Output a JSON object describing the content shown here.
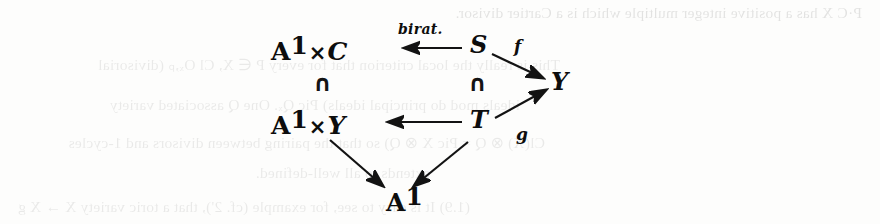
{
  "page": {
    "width": 880,
    "height": 224,
    "background_color": "#fdfdfc",
    "ink_color": "#0d0d0d"
  },
  "diagram": {
    "nodes": [
      {
        "id": "a1c",
        "label": "A¹×C",
        "base": "A",
        "exponent": "1",
        "operator": "×",
        "factor": "C"
      },
      {
        "id": "s",
        "label": "S"
      },
      {
        "id": "y",
        "label": "Y"
      },
      {
        "id": "a1y",
        "label": "A¹×Y",
        "base": "A",
        "exponent": "1",
        "operator": "×",
        "factor": "Y"
      },
      {
        "id": "t",
        "label": "T"
      },
      {
        "id": "a1",
        "label": "A¹",
        "base": "A",
        "exponent": "1"
      }
    ],
    "inclusions": [
      {
        "id": "incl-left",
        "symbol": "∩",
        "between": "A¹×C above A¹×Y"
      },
      {
        "id": "incl-right",
        "symbol": "∩",
        "between": "S above T"
      }
    ],
    "arrows": [
      {
        "id": "s-to-a1c",
        "from": "S",
        "to": "A¹×C",
        "label": "birat.",
        "direction": "left"
      },
      {
        "id": "s-to-y",
        "from": "S",
        "to": "Y",
        "label": "f",
        "direction": "down-right"
      },
      {
        "id": "t-to-a1y",
        "from": "T",
        "to": "A¹×Y",
        "label": "",
        "direction": "left"
      },
      {
        "id": "t-to-y",
        "from": "T",
        "to": "Y",
        "label": "g",
        "direction": "up-right"
      },
      {
        "id": "a1y-to-a1",
        "from": "A¹×Y",
        "to": "A¹",
        "label": "",
        "direction": "down-right"
      },
      {
        "id": "t-to-a1",
        "from": "T",
        "to": "A¹",
        "label": "",
        "direction": "down-left"
      }
    ],
    "labels": {
      "birat": "birat.",
      "f": "f",
      "g": "g"
    }
  },
  "bleed_text": {
    "lines": [
      {
        "id": "bleed-1",
        "text": "P·C X has a positive integer multiple which is a Cartier divisor."
      },
      {
        "id": "bleed-2",
        "text": "This is really the local criterion that for every P ∈ X, Cl Oₓ,ₚ (divisorial"
      },
      {
        "id": "bleed-3",
        "text": "ideals mod do principal ideals) Pic Qₓ. One Q associated variety"
      },
      {
        "id": "bleed-4",
        "text": "Cl(X) ⊗ Q = Pic X ⊗ Q) so that the pairing between divisors and 1-cycles"
      },
      {
        "id": "bleed-5",
        "text": "extends to all well-defined."
      },
      {
        "id": "bleed-6",
        "text": "(1.9) It is easy to see, for example (cf. 2'), that a toric variety X → X g"
      }
    ]
  }
}
